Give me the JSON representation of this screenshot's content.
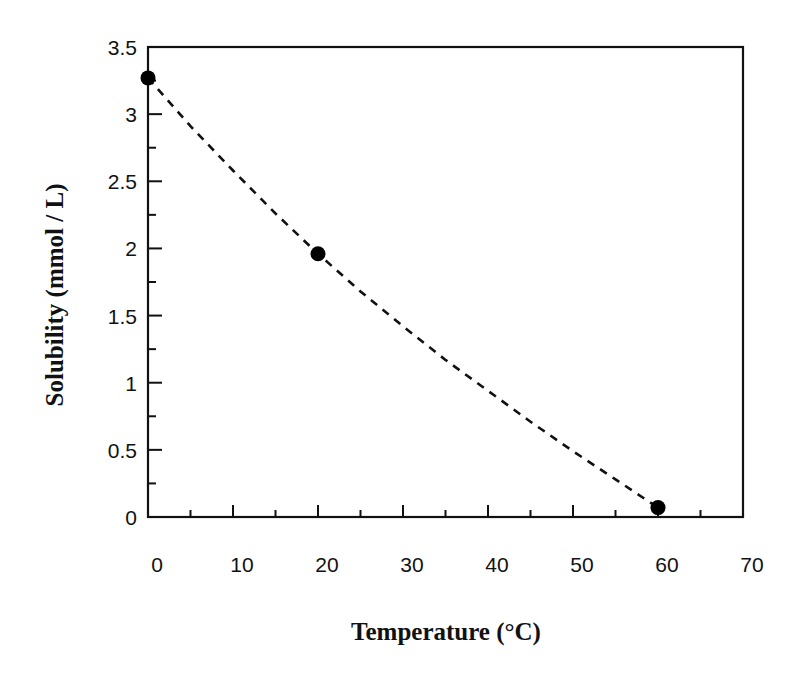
{
  "chart_data": {
    "type": "scatter",
    "title": "",
    "xlabel": "Temperature (°C)",
    "ylabel": "Solubility (mmol / L)",
    "xlim": [
      0,
      70
    ],
    "ylim": [
      0,
      3.5
    ],
    "x_ticks": [
      0,
      10,
      20,
      30,
      40,
      50,
      60,
      70
    ],
    "x_tick_labels": [
      "0",
      "10",
      "20",
      "30",
      "40",
      "50",
      "60",
      "70"
    ],
    "y_ticks": [
      0,
      0.5,
      1,
      1.5,
      2,
      2.5,
      3,
      3.5
    ],
    "y_tick_labels": [
      "0",
      "0.5",
      "1",
      "1.5",
      "2",
      "2.5",
      "3",
      "3.5"
    ],
    "x_minor_step": 5,
    "y_minor_step": 0.25,
    "grid": false,
    "legend": null,
    "series": [
      {
        "name": "Solubility",
        "marker": "filled-circle",
        "line": "dashed-smooth-fit",
        "color": "#000000",
        "x": [
          0,
          20,
          60
        ],
        "y": [
          3.27,
          1.96,
          0.07
        ]
      }
    ],
    "fit_curve_samples": {
      "x": [
        0,
        5,
        10,
        15,
        20,
        25,
        30,
        35,
        40,
        45,
        50,
        55,
        60
      ],
      "y": [
        3.27,
        2.91,
        2.58,
        2.26,
        1.96,
        1.68,
        1.42,
        1.17,
        0.94,
        0.71,
        0.49,
        0.28,
        0.07
      ]
    }
  },
  "plot_area": {
    "left": 148,
    "top": 47,
    "right": 743,
    "bottom": 517
  }
}
